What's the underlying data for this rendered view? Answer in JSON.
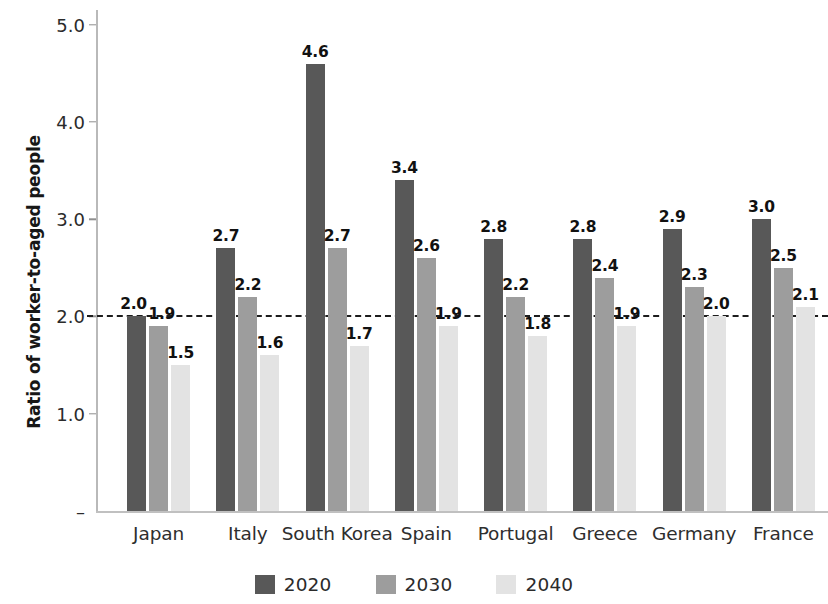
{
  "chart_data": {
    "type": "bar",
    "title": "",
    "xlabel": "",
    "ylabel": "Ratio of worker-to-aged people",
    "ylim": [
      0,
      5.15
    ],
    "ytick_labels": [
      "–",
      "1.0",
      "2.0",
      "3.0",
      "4.0",
      "5.0"
    ],
    "ytick_values": [
      0,
      1.0,
      2.0,
      3.0,
      4.0,
      5.0
    ],
    "grid": false,
    "legend_position": "bottom-center",
    "reference_line": {
      "value": 2.0,
      "style": "dashed",
      "color": "#1d1d1d"
    },
    "categories": [
      "Japan",
      "Italy",
      "South Korea",
      "Spain",
      "Portugal",
      "Greece",
      "Germany",
      "France"
    ],
    "series": [
      {
        "name": "2020",
        "color": "#585858",
        "values": [
          2.0,
          2.7,
          4.6,
          3.4,
          2.8,
          2.8,
          2.9,
          3.0
        ]
      },
      {
        "name": "2030",
        "color": "#9d9d9d",
        "values": [
          1.9,
          2.2,
          2.7,
          2.6,
          2.2,
          2.4,
          2.3,
          2.5
        ]
      },
      {
        "name": "2040",
        "color": "#e3e3e3",
        "values": [
          1.5,
          1.6,
          1.7,
          1.9,
          1.8,
          1.9,
          2.0,
          2.1
        ]
      }
    ],
    "value_labels": [
      [
        "2.0",
        "1.9",
        "1.5"
      ],
      [
        "2.7",
        "2.2",
        "1.6"
      ],
      [
        "4.6",
        "2.7",
        "1.7"
      ],
      [
        "3.4",
        "2.6",
        "1.9"
      ],
      [
        "2.8",
        "2.2",
        "1.8"
      ],
      [
        "2.8",
        "2.4",
        "1.9"
      ],
      [
        "2.9",
        "2.3",
        "2.0"
      ],
      [
        "3.0",
        "2.5",
        "2.1"
      ]
    ]
  },
  "axis": {
    "y_title": "Ratio of worker-to-aged people"
  },
  "legend": {
    "items": [
      {
        "label": "2020",
        "swatch": "series-2020-swatch"
      },
      {
        "label": "2030",
        "swatch": "series-2030-swatch"
      },
      {
        "label": "2040",
        "swatch": "series-2040-swatch"
      }
    ]
  }
}
